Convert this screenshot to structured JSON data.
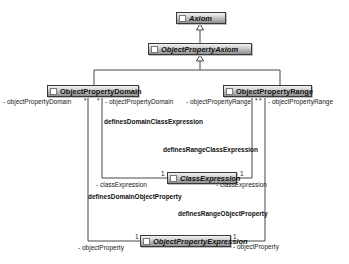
{
  "diagram": {
    "type": "UML class diagram",
    "classes": {
      "axiom": {
        "name": "Axiom",
        "abstract": true
      },
      "object_property_axiom": {
        "name": "ObjectPropertyAxiom",
        "abstract": true
      },
      "object_property_domain": {
        "name": "ObjectPropertyDomain",
        "abstract": false
      },
      "object_property_range": {
        "name": "ObjectPropertyRange",
        "abstract": false
      },
      "class_expression": {
        "name": "ClassExpression",
        "abstract": true
      },
      "object_property_expression": {
        "name": "ObjectPropertyExpression",
        "abstract": true
      }
    },
    "generalizations": [
      {
        "child": "ObjectPropertyAxiom",
        "parent": "Axiom"
      },
      {
        "child": "ObjectPropertyDomain",
        "parent": "ObjectPropertyAxiom"
      },
      {
        "child": "ObjectPropertyRange",
        "parent": "ObjectPropertyAxiom"
      }
    ],
    "associations": {
      "defines_domain_class_expression": {
        "name": "definesDomainClassExpression",
        "source_role": "- objectPropertyDomain",
        "source_mult": "*",
        "target_role": "- classExpression",
        "target_mult": "1"
      },
      "defines_range_class_expression": {
        "name": "definesRangeClassExpression",
        "source_role": "- objectPropertyRange",
        "source_mult": "*",
        "target_role": "- classExpression",
        "target_mult": "1"
      },
      "defines_domain_object_property": {
        "name": "definesDomainObjectProperty",
        "source_role": "- objectPropertyDomain",
        "source_mult": "*",
        "target_role": "- objectProperty",
        "target_mult": "1"
      },
      "defines_range_object_property": {
        "name": "definesRangeObjectProperty",
        "source_role": "- objectPropertyRange",
        "source_mult": "*",
        "target_role": "- objectProperty",
        "target_mult": "1"
      }
    }
  }
}
